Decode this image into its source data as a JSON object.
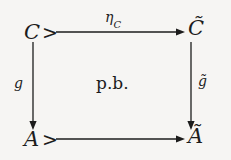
{
  "diagram": {
    "kind": "commutative-square",
    "caption": "p.b.",
    "background_color": "#f6f5f3",
    "ink_color": "#1c1c1c",
    "nodes": {
      "top_left": "C",
      "top_right": "C̃",
      "bottom_left": "A",
      "bottom_right": "Ã"
    },
    "mono_tails": {
      "top": ">",
      "bottom": ">"
    },
    "edges": {
      "top": {
        "label_base": "η",
        "label_sub": "C",
        "direction": "right"
      },
      "left": {
        "label_base": "g",
        "label_sub": "",
        "direction": "down"
      },
      "right": {
        "label_base": "g̃",
        "label_sub": "",
        "direction": "down"
      },
      "bottom": {
        "label_base": "",
        "label_sub": "",
        "direction": "right"
      }
    },
    "center": {
      "label": "p.b."
    }
  }
}
